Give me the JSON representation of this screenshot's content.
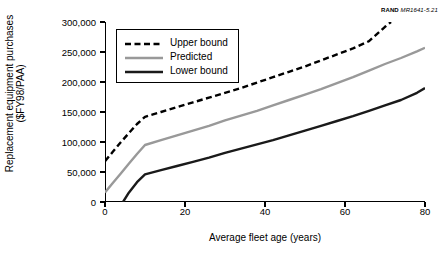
{
  "credit": {
    "org": "RAND",
    "figure_id": "MR1641-5.21"
  },
  "chart_data": {
    "type": "line",
    "title": "",
    "xlabel": "Average fleet age (years)",
    "ylabel": "Replacement equipment purchases ($FY98/PAA)",
    "ylabel_line1": "Replacement equipment purchases",
    "ylabel_line2": "($FY98/PAA)",
    "xlim": [
      0,
      80
    ],
    "ylim": [
      0,
      300000
    ],
    "grid": false,
    "legend_position": "upper-left-inside",
    "xticks": [
      0,
      20,
      40,
      60,
      80
    ],
    "xtick_labels": [
      "0",
      "20",
      "40",
      "60",
      "80"
    ],
    "yticks": [
      0,
      50000,
      100000,
      150000,
      200000,
      250000,
      300000
    ],
    "ytick_labels": [
      "0",
      "50,000",
      "100,000",
      "150,000",
      "200,000",
      "250,000",
      "300,000"
    ],
    "series": [
      {
        "name": "Upper bound",
        "style": "dashed",
        "color": "#000000",
        "width": 2.4,
        "x": [
          0,
          2,
          4,
          6,
          8,
          10,
          14,
          18,
          22,
          26,
          30,
          34,
          38,
          42,
          46,
          50,
          54,
          58,
          62,
          66,
          70,
          71.5
        ],
        "y": [
          68000,
          84000,
          100000,
          115000,
          130000,
          142000,
          150000,
          158000,
          166000,
          174000,
          182000,
          190000,
          199000,
          208000,
          217000,
          226000,
          236000,
          246000,
          256000,
          268000,
          292000,
          300000
        ]
      },
      {
        "name": "Predicted",
        "style": "solid",
        "color": "#999999",
        "width": 2.4,
        "x": [
          0,
          2,
          4,
          6,
          8,
          10,
          14,
          18,
          22,
          26,
          30,
          34,
          38,
          42,
          46,
          50,
          54,
          58,
          62,
          66,
          70,
          74,
          78,
          80
        ],
        "y": [
          16000,
          32000,
          48000,
          64000,
          80000,
          95000,
          103000,
          111000,
          119000,
          127000,
          136000,
          144000,
          152000,
          161000,
          170000,
          179000,
          188000,
          198000,
          208000,
          219000,
          230000,
          240000,
          251000,
          257000
        ]
      },
      {
        "name": "Lower bound",
        "style": "solid",
        "color": "#1a1a1a",
        "width": 2.4,
        "x": [
          4.5,
          6,
          8,
          10,
          14,
          18,
          22,
          26,
          30,
          34,
          38,
          42,
          46,
          50,
          54,
          58,
          62,
          66,
          70,
          74,
          78,
          80
        ],
        "y": [
          0,
          16000,
          33000,
          46000,
          53000,
          60000,
          67000,
          74000,
          82000,
          89000,
          96000,
          103000,
          111000,
          119000,
          127000,
          135000,
          143000,
          152000,
          161000,
          170000,
          182000,
          190000
        ]
      }
    ]
  },
  "legend": {
    "items": [
      {
        "label": "Upper bound",
        "style": "dashed",
        "color": "#000000"
      },
      {
        "label": "Predicted",
        "style": "solid",
        "color": "#999999"
      },
      {
        "label": "Lower bound",
        "style": "solid",
        "color": "#1a1a1a"
      }
    ]
  }
}
